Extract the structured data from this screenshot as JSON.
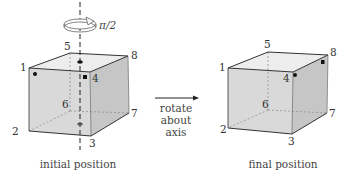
{
  "colors": {
    "front_face": "#d9d9d9",
    "side_face": "#c6c6c6",
    "top_face": "#ededed",
    "edge": "#333333",
    "hidden_edge": "#888888",
    "axis": "#222222"
  },
  "initial": {
    "caption": "initial position",
    "rotation_label": "π/2",
    "vertices": {
      "1": "1",
      "2": "2",
      "3": "3",
      "4": "4",
      "5": "5",
      "6": "6",
      "7": "7",
      "8": "8"
    }
  },
  "arrow": {
    "line1": "rotate",
    "line2": "about",
    "line3": "axis"
  },
  "final": {
    "caption": "final position",
    "vertices": {
      "1": "1",
      "2": "2",
      "3": "3",
      "4": "4",
      "5": "5",
      "6": "6",
      "7": "7",
      "8": "8"
    }
  }
}
